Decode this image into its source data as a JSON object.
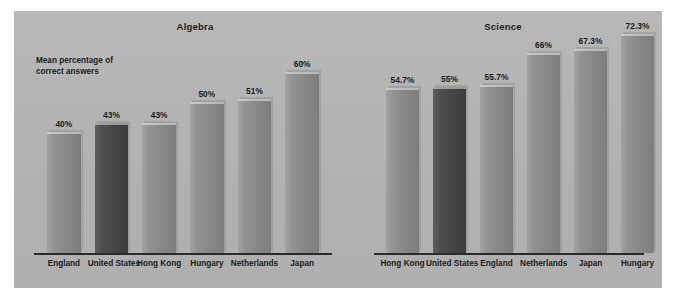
{
  "chart_data": [
    {
      "type": "bar",
      "title": "Algebra",
      "ylabel": "Mean percentage of correct answers",
      "xlabel": "",
      "categories": [
        "England",
        "United States",
        "Hong Kong",
        "Hungary",
        "Netherlands",
        "Japan"
      ],
      "values": [
        40,
        43,
        43,
        50,
        51,
        60
      ],
      "value_labels": [
        "40%",
        "43%",
        "43%",
        "50%",
        "51%",
        "60%"
      ],
      "ylim": [
        0,
        80
      ],
      "grid": false,
      "legend": "none",
      "highlight_category": "United States",
      "highlight_index": 1
    },
    {
      "type": "bar",
      "title": "Science",
      "ylabel": "",
      "xlabel": "",
      "categories": [
        "Hong Kong",
        "United States",
        "England",
        "Netherlands",
        "Japan",
        "Hungary"
      ],
      "values": [
        54.7,
        55,
        55.7,
        66,
        67.3,
        72.3
      ],
      "value_labels": [
        "54.7%",
        "55%",
        "55.7%",
        "66%",
        "67.3%",
        "72.3%"
      ],
      "ylim": [
        0,
        80
      ],
      "grid": false,
      "legend": "none",
      "highlight_category": "United States",
      "highlight_index": 1
    }
  ],
  "figure": {
    "axis_caption_line1": "Mean percentage of",
    "axis_caption_line2": "correct answers",
    "colors": {
      "page_background": "#ffffff",
      "plate_background": "#b4b4b4",
      "bar_fill": "#8a8a8a",
      "bar_highlight_fill": "#454545",
      "text": "#1b1b1b",
      "axis_line": "#2a2a2a"
    }
  }
}
